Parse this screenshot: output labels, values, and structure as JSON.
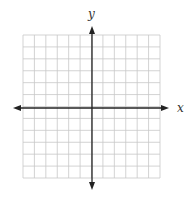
{
  "diagram": {
    "type": "coordinate-grid",
    "x_axis_label": "x",
    "y_axis_label": "y",
    "grid": {
      "columns": 12,
      "rows": 12,
      "left": 23,
      "top": 35,
      "right": 160,
      "bottom": 178
    },
    "origin": {
      "x": 92,
      "y": 108
    },
    "colors": {
      "grid_line": "#c8c8c8",
      "axis": "#222222",
      "label": "#333333"
    }
  }
}
